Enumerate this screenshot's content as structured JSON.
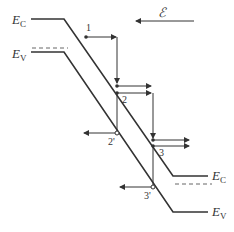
{
  "diagram": {
    "type": "band-diagram",
    "labels": {
      "ec_left": "E",
      "ec_left_sub": "C",
      "ev_left": "E",
      "ev_left_sub": "V",
      "ec_right": "E",
      "ec_right_sub": "C",
      "ev_right": "E",
      "ev_right_sub": "V",
      "field": "ℰ",
      "p1": "1",
      "p2": "2",
      "p2p": "2'",
      "p3": "3",
      "p3p": "3'"
    },
    "colors": {
      "line": "#333333",
      "dashed": "#666666",
      "background": "#ffffff"
    }
  }
}
